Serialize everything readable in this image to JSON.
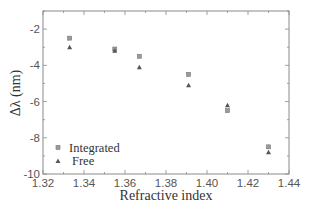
{
  "chart_data": {
    "type": "scatter",
    "title": "",
    "xlabel": "Refractive index",
    "ylabel": "Δλ (nm)",
    "xlim": [
      1.32,
      1.44
    ],
    "ylim": [
      -10,
      -1
    ],
    "xticks": [
      "1.32",
      "1.34",
      "1.36",
      "1.38",
      "1.40",
      "1.42",
      "1.44"
    ],
    "yticks": [
      "-2",
      "-4",
      "-6",
      "-8",
      "-10"
    ],
    "grid": false,
    "legend_position": "lower left",
    "series": [
      {
        "name": "Integrated",
        "marker": "square",
        "x": [
          1.333,
          1.355,
          1.367,
          1.391,
          1.41,
          1.43
        ],
        "y": [
          -2.5,
          -3.1,
          -3.5,
          -4.5,
          -6.5,
          -8.5
        ]
      },
      {
        "name": "Free",
        "marker": "triangle",
        "x": [
          1.333,
          1.355,
          1.367,
          1.391,
          1.41,
          1.43
        ],
        "y": [
          -3.0,
          -3.2,
          -4.1,
          -5.1,
          -6.2,
          -8.8
        ]
      }
    ]
  },
  "colors": {
    "axis": "#8a8a8a",
    "integrated_marker": "#9a9a9a",
    "free_marker": "#555555"
  }
}
